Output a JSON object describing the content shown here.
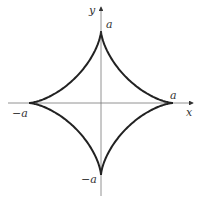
{
  "figure": {
    "curve": "x^(2/3) + y^(2/3) = a^(2/3)",
    "axes": {
      "x_label": "x",
      "y_label": "y"
    },
    "labels": {
      "top": "a",
      "right": "a",
      "left": "−a",
      "bottom": "−a"
    },
    "colors": {
      "curve": "#222222",
      "axes": "#777777",
      "text": "#333333"
    }
  }
}
